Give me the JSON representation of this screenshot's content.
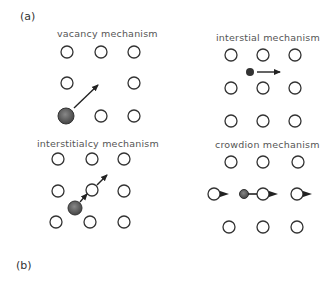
{
  "panels": {
    "a_label": "(a)",
    "b_label": "(b)"
  },
  "mechanisms": [
    {
      "id": "vacancy",
      "label": "vacancy mechanism"
    },
    {
      "id": "interstitial",
      "label": "interstial mechanism"
    },
    {
      "id": "interstitialcy",
      "label": "interstitialcy mechanism"
    },
    {
      "id": "crowdion",
      "label": "crowdion mechanism"
    }
  ],
  "colors": {
    "lattice_stroke": "#333333",
    "filled_atom": "#555555",
    "arrow": "#222222"
  }
}
